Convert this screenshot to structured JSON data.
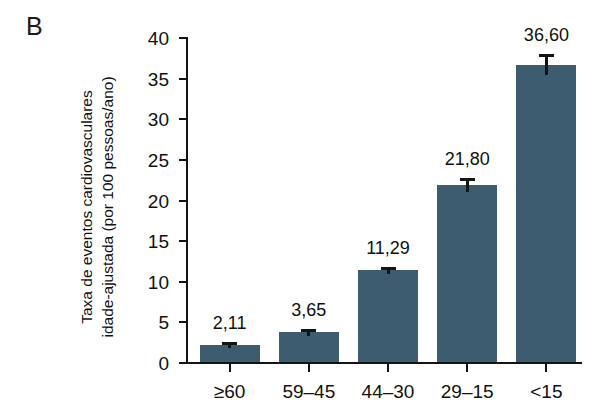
{
  "panel": {
    "label": "B"
  },
  "axes": {
    "y_title_line1": "Taxa de eventos cardiovasculares",
    "y_title_line2": "idade-ajustada (por 100 pessoas/ano)",
    "y_ticks": [
      "0",
      "5",
      "10",
      "15",
      "20",
      "25",
      "30",
      "35",
      "40"
    ],
    "x_title": ""
  },
  "chart_data": {
    "type": "bar",
    "title": "",
    "subtitle": "",
    "xlabel": "",
    "ylabel": "Taxa de eventos cardiovasculares idade-ajustada (por 100 pessoas/ano)",
    "categories": [
      "≥60",
      "59–45",
      "44–30",
      "29–15",
      "<15"
    ],
    "values": [
      2.11,
      3.65,
      11.29,
      21.8,
      36.6
    ],
    "value_labels": [
      "2,11",
      "3,65",
      "11,29",
      "21,80",
      "36,60"
    ],
    "errors": [
      0.35,
      0.4,
      0.45,
      0.9,
      1.3
    ],
    "ylim": [
      0,
      40
    ],
    "ytick_step": 5,
    "grid": false,
    "legend": null,
    "bar_color": "#3d5c70",
    "axis_color": "#141414",
    "background": "#ffffff"
  }
}
